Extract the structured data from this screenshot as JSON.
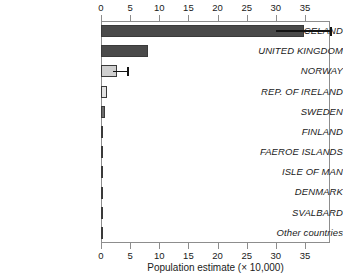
{
  "chart_data": {
    "type": "bar",
    "orientation": "horizontal",
    "title": "",
    "xlabel": "Population estimate (× 10,000)",
    "ylabel": "",
    "xlim": [
      0,
      39.3
    ],
    "xticks": [
      0,
      5,
      10,
      15,
      20,
      25,
      30,
      35
    ],
    "xtick_labels": [
      "0",
      "5",
      "10",
      "15",
      "20",
      "25",
      "30",
      "35"
    ],
    "axis_top": true,
    "axis_bottom": true,
    "grid": false,
    "legend": "none",
    "categories": [
      "ICELAND",
      "UNITED KINGDOM",
      "NORWAY",
      "REP. OF IRELAND",
      "SWEDEN",
      "FINLAND",
      "FAEROE ISLANDS",
      "ISLE OF MAN",
      "DENMARK",
      "SVALBARD",
      "Other countries"
    ],
    "values": [
      34.8,
      8.0,
      2.8,
      1.1,
      0.7,
      0.4,
      0.25,
      0.06,
      0.05,
      0.04,
      0.04
    ],
    "bar_colors": [
      "#4a4a4a",
      "#4a4a4a",
      "#cfcfcf",
      "#e2e2e2",
      "#6b6b6b",
      "#4a4a4a",
      "#4a4a4a",
      "#4a4a4a",
      "#4a4a4a",
      "#4a4a4a",
      "#4a4a4a"
    ],
    "error_bars": [
      {
        "category": "ICELAND",
        "low": 30.0,
        "high": 39.3
      },
      {
        "category": "NORWAY",
        "low": 2.0,
        "high": 4.5
      }
    ],
    "colors": {
      "bar_dark": "#4a4a4a",
      "bar_light": "#cfcfcf",
      "bar_lighter": "#e2e2e2",
      "bar_edge": "#3a3a3a",
      "axis": "#8d8d8d",
      "text": "#1a1a1a",
      "background": "#ffffff"
    }
  }
}
